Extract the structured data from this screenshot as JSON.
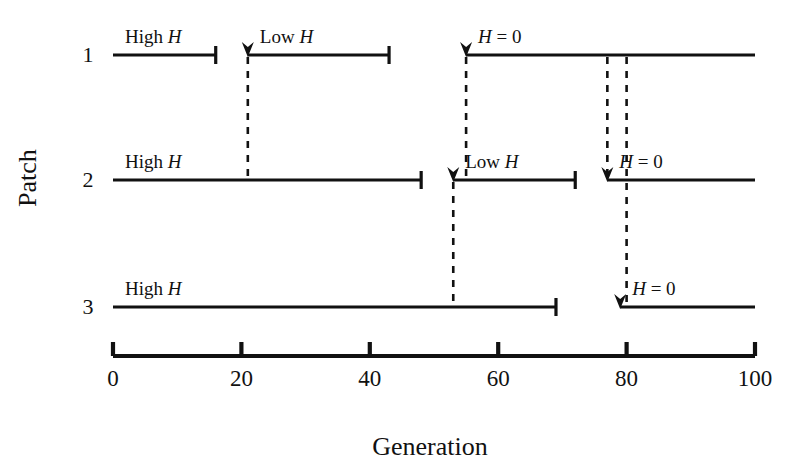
{
  "figure": {
    "title": "",
    "x_axis_title": "Generation",
    "y_axis_title": "Patch"
  },
  "chart_data": {
    "type": "line",
    "title": "",
    "xlabel": "Generation",
    "ylabel": "Patch",
    "xlim": [
      0,
      100
    ],
    "xticks": [
      0,
      20,
      40,
      60,
      80,
      100
    ],
    "xtick_labels": [
      "0",
      "20",
      "40",
      "60",
      "80",
      "100"
    ],
    "grid": false,
    "legend": "none",
    "rows": [
      {
        "row_label": "1",
        "segments": [
          {
            "label_main": "High",
            "label_italic": "H",
            "label_eq": "",
            "x_start": 0,
            "x_end": 16,
            "start_cap": "none",
            "end_cap": "tick",
            "has_arrow": false
          },
          {
            "label_main": "Low",
            "label_italic": "H",
            "label_eq": "",
            "x_start": 21,
            "x_end": 43,
            "start_cap": "arrow",
            "end_cap": "tick",
            "has_arrow": true
          },
          {
            "label_main": "",
            "label_italic": "H",
            "label_eq": "= 0",
            "x_start": 55,
            "x_end": 100,
            "start_cap": "arrow",
            "end_cap": "none",
            "has_arrow": true
          }
        ]
      },
      {
        "row_label": "2",
        "segments": [
          {
            "label_main": "High",
            "label_italic": "H",
            "label_eq": "",
            "x_start": 0,
            "x_end": 48,
            "start_cap": "none",
            "end_cap": "tick",
            "has_arrow": false
          },
          {
            "label_main": "Low",
            "label_italic": "H",
            "label_eq": "",
            "x_start": 53,
            "x_end": 72,
            "start_cap": "arrow",
            "end_cap": "tick",
            "has_arrow": true
          },
          {
            "label_main": "",
            "label_italic": "H",
            "label_eq": "= 0",
            "x_start": 77,
            "x_end": 100,
            "start_cap": "arrow",
            "end_cap": "none",
            "has_arrow": true
          }
        ]
      },
      {
        "row_label": "3",
        "segments": [
          {
            "label_main": "High",
            "label_italic": "H",
            "label_eq": "",
            "x_start": 0,
            "x_end": 69,
            "start_cap": "none",
            "end_cap": "tick",
            "has_arrow": false
          },
          {
            "label_main": "",
            "label_italic": "H",
            "label_eq": "= 0",
            "x_start": 79,
            "x_end": 100,
            "start_cap": "arrow",
            "end_cap": "none",
            "has_arrow": true
          }
        ]
      }
    ],
    "dashed_connectors": [
      {
        "name": "row1-low-h-onset",
        "x": 21,
        "from_row": 1,
        "to_row": 2
      },
      {
        "name": "row1-h0-onset",
        "x": 55,
        "from_row": 1,
        "to_row": 2
      },
      {
        "name": "row2-low-h-onset",
        "x": 53,
        "from_row": 2,
        "to_row": 3
      },
      {
        "name": "row2-h0-onset",
        "x": 77,
        "from_row": 1,
        "to_row": 2
      },
      {
        "name": "row3-h0-onset",
        "x": 80,
        "from_row": 1,
        "to_row": 3
      }
    ]
  }
}
